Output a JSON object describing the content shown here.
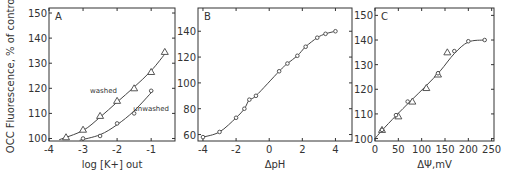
{
  "figure": {
    "panels": [
      {
        "letter": "A",
        "ylabel": "OCC Fluorescence, % of control",
        "xlabel": "log [K+] out"
      },
      {
        "letter": "B",
        "ylabel": "",
        "xlabel": "ΔpH"
      },
      {
        "letter": "C",
        "ylabel": "",
        "xlabel": "ΔΨ,mV"
      }
    ]
  },
  "chart_data": [
    {
      "type": "line",
      "panel": "A",
      "title": "",
      "xlabel": "log [K+] out",
      "ylabel": "OCC Fluorescence, % of control",
      "xlim": [
        -4,
        -0.3
      ],
      "ylim": [
        99,
        152
      ],
      "xticks": [
        -4,
        -3,
        -2,
        -1
      ],
      "yticks": [
        100,
        110,
        120,
        130,
        140,
        150
      ],
      "grid": false,
      "annotations": [
        "washed",
        "unwashed"
      ],
      "series": [
        {
          "name": "washed",
          "marker": "triangle",
          "x": [
            -3.5,
            -3.0,
            -2.5,
            -2.0,
            -1.5,
            -1.0,
            -0.6
          ],
          "y": [
            100.5,
            103.5,
            109,
            115,
            120,
            126.5,
            134.5
          ]
        },
        {
          "name": "unwashed",
          "marker": "circle",
          "x": [
            -3.0,
            -2.5,
            -2.0,
            -1.5,
            -1.0
          ],
          "y": [
            100,
            101,
            106,
            110,
            119
          ]
        }
      ]
    },
    {
      "type": "line",
      "panel": "B",
      "title": "",
      "xlabel": "ΔpH",
      "ylabel": "",
      "xlim": [
        -4.3,
        5
      ],
      "ylim": [
        55,
        158
      ],
      "xticks": [
        -4,
        -2,
        0,
        2,
        4
      ],
      "yticks": [
        60,
        80,
        100,
        120,
        140
      ],
      "grid": false,
      "series": [
        {
          "name": "data",
          "marker": "circle",
          "x": [
            -4.0,
            -3.0,
            -2.0,
            -1.5,
            -1.2,
            -0.8,
            0.6,
            1.1,
            1.7,
            2.2,
            2.9,
            3.4,
            4.0
          ],
          "y": [
            58,
            62,
            73,
            80,
            87,
            90,
            109,
            115,
            121,
            128,
            135,
            138,
            140
          ]
        }
      ]
    },
    {
      "type": "line",
      "panel": "C",
      "title": "",
      "xlabel": "ΔΨ,mV",
      "ylabel": "",
      "xlim": [
        0,
        255
      ],
      "ylim": [
        99,
        153
      ],
      "xticks": [
        0,
        50,
        100,
        150,
        200,
        250
      ],
      "yticks": [
        100,
        110,
        120,
        130,
        140,
        150
      ],
      "grid": false,
      "series": [
        {
          "name": "triangles",
          "marker": "triangle",
          "x": [
            15,
            50,
            80,
            110,
            135,
            155
          ],
          "y": [
            103.5,
            109,
            115,
            120.5,
            126,
            135
          ]
        },
        {
          "name": "circles",
          "marker": "circle",
          "x": [
            15,
            45,
            70,
            135,
            170,
            200,
            235
          ],
          "y": [
            103.5,
            109.5,
            115,
            126.5,
            135.5,
            139.5,
            140
          ]
        }
      ]
    }
  ]
}
